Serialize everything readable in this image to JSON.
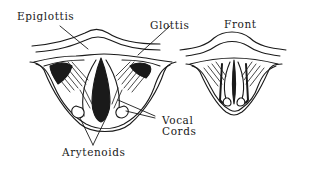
{
  "diagram": {
    "labels": {
      "epiglottis": "Epiglottis",
      "glottis": "Glottis",
      "front": "Front",
      "vocal_line1": "Vocal",
      "vocal_line2": "Cords",
      "arytenoids": "Arytenoids"
    },
    "figures": [
      {
        "name": "open-glottis-view",
        "state": "open"
      },
      {
        "name": "closed-glottis-view",
        "state": "closed"
      }
    ],
    "colors": {
      "ink": "#1a1a1a",
      "background": "#ffffff"
    }
  }
}
